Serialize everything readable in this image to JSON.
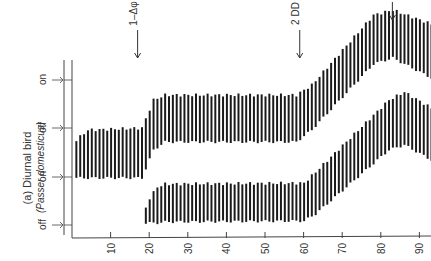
{
  "panel": {
    "title": "(a) Diurnal bird",
    "subtitle": "(Passer domesticus)"
  },
  "state_labels": [
    "on",
    "off",
    "on",
    "off"
  ],
  "annotations": [
    {
      "label": "1–Δφ",
      "day": 17
    },
    {
      "label": "2 DD",
      "day": 59
    },
    {
      "label": "",
      "day": 83
    }
  ],
  "chart_data": {
    "type": "actogram",
    "title": "(a) Diurnal bird (Passer domesticus)",
    "xlabel": "Day",
    "ylabel": "Activity state (on / off)",
    "x_ticks": [
      10,
      20,
      30,
      40,
      50,
      60,
      70,
      80,
      90
    ],
    "xlim": [
      0,
      93
    ],
    "annotations": [
      {
        "text": "1–Δφ",
        "x": 17
      },
      {
        "text": "2 DD",
        "x": 59
      },
      {
        "text": "arrow",
        "x": 83
      }
    ],
    "series": [
      {
        "name": "upper record",
        "description": "activity bands, top = onset, bottom = offset (pixel y)",
        "keypoints": [
          {
            "day": 1,
            "top": 140,
            "bottom": 178
          },
          {
            "day": 4,
            "top": 130,
            "bottom": 178
          },
          {
            "day": 18,
            "top": 128,
            "bottom": 178
          },
          {
            "day": 21,
            "top": 100,
            "bottom": 150
          },
          {
            "day": 24,
            "top": 95,
            "bottom": 142
          },
          {
            "day": 58,
            "top": 95,
            "bottom": 142
          },
          {
            "day": 62,
            "top": 85,
            "bottom": 130
          },
          {
            "day": 78,
            "top": 15,
            "bottom": 64
          },
          {
            "day": 83,
            "top": 10,
            "bottom": 58
          },
          {
            "day": 93,
            "top": 24,
            "bottom": 78
          }
        ]
      },
      {
        "name": "lower record",
        "keypoints": [
          {
            "day": 19,
            "top": 208,
            "bottom": 223
          },
          {
            "day": 20,
            "top": 198,
            "bottom": 223
          },
          {
            "day": 22,
            "top": 187,
            "bottom": 223
          },
          {
            "day": 24,
            "top": 184,
            "bottom": 222
          },
          {
            "day": 60,
            "top": 183,
            "bottom": 221
          },
          {
            "day": 63,
            "top": 172,
            "bottom": 214
          },
          {
            "day": 82,
            "top": 100,
            "bottom": 150
          },
          {
            "day": 86,
            "top": 92,
            "bottom": 145
          },
          {
            "day": 93,
            "top": 108,
            "bottom": 160
          }
        ]
      }
    ]
  }
}
